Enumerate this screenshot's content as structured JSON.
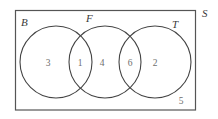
{
  "figure": {
    "universal_set": {
      "label": "S",
      "outside_count": "5"
    },
    "sets": [
      {
        "key": "B",
        "label": "B",
        "count_only": "3"
      },
      {
        "key": "F",
        "label": "F",
        "count_only": "4"
      },
      {
        "key": "T",
        "label": "T",
        "count_only": "2"
      }
    ],
    "intersections": [
      {
        "key": "BF",
        "label": "B and F",
        "count": "1"
      },
      {
        "key": "FT",
        "label": "F and T",
        "count": "6"
      }
    ],
    "regions": [
      {
        "name": "b-only",
        "value": "3"
      },
      {
        "name": "b-and-f",
        "value": "1"
      },
      {
        "name": "f-only",
        "value": "4"
      },
      {
        "name": "f-and-t",
        "value": "6"
      },
      {
        "name": "t-only",
        "value": "2"
      },
      {
        "name": "outside-all",
        "value": "5"
      }
    ],
    "colors": {
      "stroke": "#444444",
      "rect_stroke": "#555555",
      "label_text": "#3a3a3a",
      "count_text": "#6e6e6e",
      "background": "#ffffff"
    }
  }
}
